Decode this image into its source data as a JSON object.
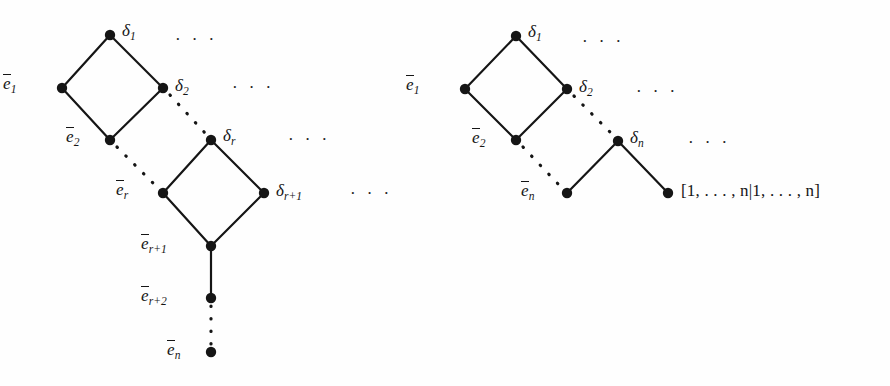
{
  "figure": {
    "width": 890,
    "height": 386,
    "background_color": "#fefefe",
    "ink_color": "#151515",
    "ellipsis": "· · ·"
  },
  "left_diagram": {
    "name": "left-poset-diagram",
    "labels": {
      "d1": "δ",
      "d1_sub": "1",
      "d2": "δ",
      "d2_sub": "2",
      "dr": "δ",
      "dr_sub": "r",
      "dr1": "δ",
      "dr1_sub": "r+1",
      "e1": "e",
      "e1_sub": "1",
      "e2": "e",
      "e2_sub": "2",
      "er": "e",
      "er_sub": "r",
      "er1": "e",
      "er1_sub": "r+1",
      "er2": "e",
      "er2_sub": "r+2",
      "en": "e",
      "en_sub": "n"
    },
    "ellipses": [
      "· · ·",
      "· · ·",
      "· · ·",
      "· · ·"
    ],
    "nodes": [
      {
        "id": "delta1",
        "x": 110,
        "y": 35,
        "label": "δ1"
      },
      {
        "id": "ebar1",
        "x": 62,
        "y": 88,
        "label": "ē1"
      },
      {
        "id": "delta2",
        "x": 163,
        "y": 88,
        "label": "δ2"
      },
      {
        "id": "ebar2",
        "x": 110,
        "y": 140,
        "label": "ē2"
      },
      {
        "id": "deltar",
        "x": 211,
        "y": 140,
        "label": "δr"
      },
      {
        "id": "ebarr",
        "x": 163,
        "y": 193,
        "label": "ēr"
      },
      {
        "id": "deltar1",
        "x": 264,
        "y": 193,
        "label": "δr+1"
      },
      {
        "id": "ebarr1",
        "x": 211,
        "y": 246,
        "label": "ēr+1"
      },
      {
        "id": "ebarr2",
        "x": 211,
        "y": 298,
        "label": "ēr+2"
      },
      {
        "id": "ebarn",
        "x": 211,
        "y": 352,
        "label": "ēn"
      }
    ],
    "solid_edges": [
      [
        "delta1",
        "ebar1"
      ],
      [
        "delta1",
        "delta2"
      ],
      [
        "ebar1",
        "ebar2"
      ],
      [
        "delta2",
        "ebar2"
      ],
      [
        "deltar",
        "ebarr"
      ],
      [
        "deltar",
        "deltar1"
      ],
      [
        "ebarr",
        "ebarr1"
      ],
      [
        "deltar1",
        "ebarr1"
      ],
      [
        "ebarr1",
        "ebarr2"
      ]
    ],
    "dotted_edges": [
      [
        "delta2",
        "deltar"
      ],
      [
        "ebar2",
        "ebarr"
      ],
      [
        "ebarr2",
        "ebarn"
      ]
    ]
  },
  "right_diagram": {
    "name": "right-poset-diagram",
    "labels": {
      "d1": "δ",
      "d1_sub": "1",
      "d2": "δ",
      "d2_sub": "2",
      "dn": "δ",
      "dn_sub": "n",
      "e1": "e",
      "e1_sub": "1",
      "e2": "e",
      "e2_sub": "2",
      "en": "e",
      "en_sub": "n",
      "interval": "[1, . . . , n|1, . . . , n]"
    },
    "ellipses": [
      "· · ·",
      "· · ·",
      "· · ·"
    ],
    "nodes": [
      {
        "id": "delta1",
        "x": 516,
        "y": 36,
        "label": "δ1"
      },
      {
        "id": "ebar1",
        "x": 465,
        "y": 89,
        "label": "ē1"
      },
      {
        "id": "delta2",
        "x": 567,
        "y": 89,
        "label": "δ2"
      },
      {
        "id": "ebar2",
        "x": 516,
        "y": 140,
        "label": "ē2"
      },
      {
        "id": "deltan",
        "x": 618,
        "y": 141,
        "label": "δn"
      },
      {
        "id": "ebarn",
        "x": 567,
        "y": 193,
        "label": "ēn"
      },
      {
        "id": "topelt",
        "x": 668,
        "y": 193,
        "label": "[1,...,n|1,...,n]"
      }
    ],
    "solid_edges": [
      [
        "delta1",
        "ebar1"
      ],
      [
        "delta1",
        "delta2"
      ],
      [
        "ebar1",
        "ebar2"
      ],
      [
        "delta2",
        "ebar2"
      ],
      [
        "deltan",
        "ebarn"
      ],
      [
        "deltan",
        "topelt"
      ]
    ],
    "dotted_edges": [
      [
        "delta2",
        "deltan"
      ],
      [
        "ebar2",
        "ebarn"
      ]
    ]
  }
}
